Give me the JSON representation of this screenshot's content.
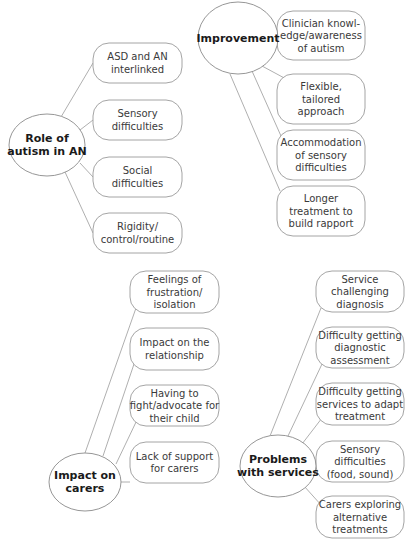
{
  "clusters": [
    {
      "id": "role-of-autism",
      "center_label": [
        "Role of",
        "autism in AN"
      ],
      "items": [
        [
          "ASD and AN",
          "interlinked"
        ],
        [
          "Sensory",
          "difficulties"
        ],
        [
          "Social",
          "difficulties"
        ],
        [
          "Rigidity/",
          "control/routine"
        ]
      ]
    },
    {
      "id": "improvement",
      "center_label": [
        "Improvement"
      ],
      "items": [
        [
          "Clinician knowl-",
          "edge/awareness",
          "of autism"
        ],
        [
          "Flexible,",
          "tailored",
          "approach"
        ],
        [
          "Accommodation",
          "of sensory",
          "difficulties"
        ],
        [
          "Longer",
          "treatment to",
          "build rapport"
        ]
      ]
    },
    {
      "id": "impact-on-carers",
      "center_label": [
        "Impact on",
        "carers"
      ],
      "items": [
        [
          "Feelings of",
          "frustration/",
          "isolation"
        ],
        [
          "Impact on the",
          "relationship"
        ],
        [
          "Having to",
          "fight/advocate for",
          "their child"
        ],
        [
          "Lack of support",
          "for carers"
        ]
      ]
    },
    {
      "id": "problems-with-services",
      "center_label": [
        "Problems",
        "with services"
      ],
      "items": [
        [
          "Service",
          "challenging",
          "diagnosis"
        ],
        [
          "Difficulty getting",
          "diagnostic",
          "assessment"
        ],
        [
          "Difficulty getting",
          "services to adapt",
          "treatment"
        ],
        [
          "Sensory",
          "difficulties",
          "(food, sound)"
        ],
        [
          "Carers exploring",
          "alternative",
          "treatments"
        ]
      ]
    }
  ]
}
